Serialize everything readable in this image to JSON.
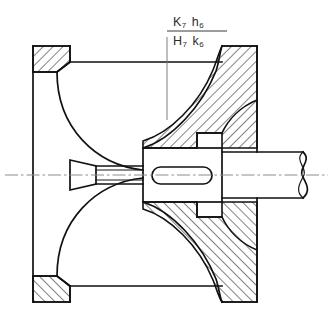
{
  "drawing": {
    "title": "Shaft-hub cone coupling sectional view",
    "background_color": "#ffffff",
    "line_color": "#111111",
    "centerline_color": "#8c8c8c",
    "leader_color": "#6f6f6f",
    "annotation": {
      "name": "fit-tolerance-callout",
      "numerator": "K",
      "numerator_grade": "7",
      "numerator_second": "h",
      "numerator_second_grade": "6",
      "denominator": "H",
      "denominator_grade": "7",
      "denominator_second": "k",
      "denominator_second_grade": "6",
      "full_text": "K7 h6 / H7 k6",
      "leader_target_x": 167,
      "leader_target_y": 120
    },
    "features": [
      {
        "name": "outer-body-wall",
        "type": "vertical-wall",
        "x": 33
      },
      {
        "name": "top-left-flange",
        "type": "hatched-flange",
        "x": 33,
        "y": 46,
        "w": 37,
        "h": 26
      },
      {
        "name": "bottom-left-flange",
        "type": "hatched-flange",
        "x": 33,
        "y": 276,
        "w": 37,
        "h": 26
      },
      {
        "name": "top-right-rim",
        "type": "hatched-rim",
        "x": 222,
        "y": 46
      },
      {
        "name": "bottom-right-rim",
        "type": "hatched-rim",
        "x": 222,
        "y": 276
      },
      {
        "name": "conical-web-upper",
        "type": "hatched-cone-web"
      },
      {
        "name": "conical-web-lower",
        "type": "hatched-cone-web"
      },
      {
        "name": "hub-body",
        "type": "unhatched-hub",
        "x": 143,
        "y": 148,
        "w": 79,
        "h": 54
      },
      {
        "name": "keyway-slot",
        "type": "rounded-slot",
        "x": 152,
        "y": 167,
        "w": 60,
        "h": 17
      },
      {
        "name": "shaft",
        "type": "cylinder",
        "x": 222,
        "y": 152,
        "w": 98,
        "h": 46
      },
      {
        "name": "shaft-break-line",
        "type": "break-symbol",
        "x": 300
      },
      {
        "name": "left-cone-nose",
        "type": "tapered-cone",
        "x": 70,
        "y": 160,
        "w": 28,
        "h": 30
      },
      {
        "name": "centerline-axis",
        "type": "axis",
        "y": 175
      }
    ]
  }
}
